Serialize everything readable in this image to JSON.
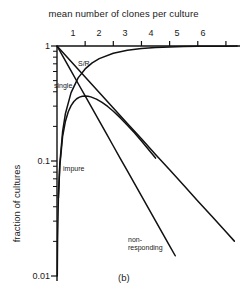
{
  "chart_data": {
    "type": "line",
    "title": "mean number of clones per culture",
    "xlabel": "mean number of clones per culture",
    "ylabel": "fraction of cultures",
    "panel": "(b)",
    "xlim": [
      0,
      6.5
    ],
    "ylim": [
      0.01,
      1
    ],
    "yscale": "log",
    "xscale": "linear",
    "grid": false,
    "legend": "inline-curve-labels",
    "x_axis_position": "top",
    "xticks": [
      1,
      2,
      3,
      4,
      5,
      6
    ],
    "xtick_labels": [
      "1",
      "2",
      "3",
      "4",
      "5",
      "6"
    ],
    "yticks": [
      1,
      0.1,
      0.01
    ],
    "ytick_labels": [
      "1",
      "0.1",
      "0.01"
    ],
    "y_minor_ticks": [
      0.9,
      0.8,
      0.7,
      0.6,
      0.5,
      0.4,
      0.3,
      0.2,
      0.09,
      0.08,
      0.07,
      0.06,
      0.05,
      0.04,
      0.03,
      0.02
    ],
    "series": [
      {
        "name": "non-responding",
        "label": "non-\nresponding",
        "formula": "exp(-m)",
        "x": [
          0,
          0.25,
          0.5,
          0.75,
          1,
          1.25,
          1.5,
          1.75,
          2,
          2.25,
          2.5,
          2.75,
          3,
          3.25,
          3.5,
          3.75,
          4,
          4.2
        ],
        "values": [
          1,
          0.779,
          0.607,
          0.472,
          0.368,
          0.287,
          0.223,
          0.174,
          0.135,
          0.105,
          0.082,
          0.064,
          0.0498,
          0.0388,
          0.0302,
          0.0235,
          0.0183,
          0.015
        ]
      },
      {
        "name": "single",
        "label": "single",
        "formula": "m*exp(-m)",
        "x": [
          0.05,
          0.1,
          0.2,
          0.3,
          0.4,
          0.5,
          0.6,
          0.7,
          0.8,
          0.9,
          1,
          1.1,
          1.2,
          1.4,
          1.6,
          1.8,
          2,
          2.25,
          2.5,
          2.75,
          3,
          3.25,
          3.5
        ],
        "values": [
          0.0476,
          0.0905,
          0.164,
          0.222,
          0.268,
          0.303,
          0.329,
          0.348,
          0.359,
          0.366,
          0.368,
          0.366,
          0.361,
          0.345,
          0.323,
          0.298,
          0.271,
          0.237,
          0.205,
          0.176,
          0.149,
          0.126,
          0.106
        ]
      },
      {
        "name": "S/R",
        "label": "S/R",
        "formula": "exp(-0.62*m)",
        "x": [
          0,
          0.5,
          1,
          1.5,
          2,
          2.5,
          3,
          3.5,
          4,
          4.5,
          5,
          5.5,
          6,
          6.3
        ],
        "values": [
          1,
          0.733,
          0.538,
          0.395,
          0.289,
          0.212,
          0.156,
          0.114,
          0.0838,
          0.0614,
          0.045,
          0.033,
          0.0242,
          0.0201
        ]
      },
      {
        "name": "impure",
        "label": "impure",
        "formula": "1-exp(-m)",
        "x": [
          0.01,
          0.02,
          0.05,
          0.1,
          0.2,
          0.3,
          0.5,
          0.75,
          1,
          1.25,
          1.5,
          2,
          2.5,
          3,
          3.5,
          4,
          4.5,
          5,
          5.5,
          6,
          6.4
        ],
        "values": [
          0.00995,
          0.0198,
          0.0488,
          0.0952,
          0.181,
          0.259,
          0.393,
          0.528,
          0.632,
          0.713,
          0.777,
          0.865,
          0.918,
          0.95,
          0.97,
          0.982,
          0.989,
          0.993,
          0.996,
          0.9975,
          0.998
        ]
      }
    ]
  },
  "labels": {
    "title": "mean number of clones per culture",
    "ylabel": "fraction of cultures",
    "panel": "(b)",
    "curve_sr": "S/R",
    "curve_single": "single",
    "curve_impure": "impure",
    "curve_nonresponding_line1": "non-",
    "curve_nonresponding_line2": "responding"
  },
  "ticks": {
    "x": [
      "1",
      "2",
      "3",
      "4",
      "5",
      "6"
    ],
    "y": [
      "1",
      "0.1",
      "0.01"
    ]
  },
  "colors": {
    "background": "#ffffff",
    "ink": "#111111",
    "text": "#1a1a1a"
  }
}
